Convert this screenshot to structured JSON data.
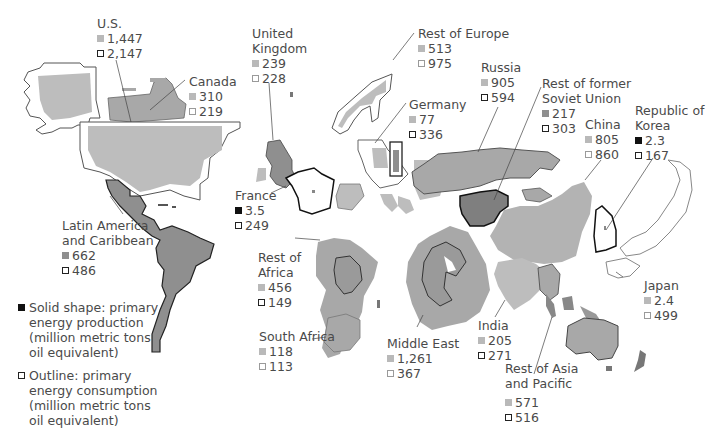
{
  "legend": {
    "production": "Solid shape: primary energy production (million metric tons oil equivalent)",
    "production_lines": [
      "Solid shape: primary",
      "energy production",
      "(million metric tons",
      "oil equivalent)"
    ],
    "consumption": "Outline: primary energy consumption (million metric tons oil equivalent)",
    "consumption_lines": [
      "Outline: primary",
      "energy consumption",
      "(million metric tons",
      "oil equivalent)"
    ]
  },
  "regions": {
    "us": {
      "name": "U.S.",
      "production": "1,447",
      "consumption": "2,147"
    },
    "canada": {
      "name": "Canada",
      "production": "310",
      "consumption": "219"
    },
    "uk": {
      "name_line1": "United",
      "name_line2": "Kingdom",
      "production": "239",
      "consumption": "228"
    },
    "rest_europe": {
      "name": "Rest of Europe",
      "production": "513",
      "consumption": "975"
    },
    "germany": {
      "name": "Germany",
      "production": "77",
      "consumption": "336"
    },
    "russia": {
      "name": "Russia",
      "production": "905",
      "consumption": "594"
    },
    "rest_fsu": {
      "name_line1": "Rest of former",
      "name_line2": "Soviet Union",
      "production": "217",
      "consumption": "303"
    },
    "china": {
      "name": "China",
      "production": "805",
      "consumption": "860"
    },
    "korea": {
      "name_line1": "Republic of",
      "name_line2": "Korea",
      "production": "2.3",
      "consumption": "167"
    },
    "france": {
      "name": "France",
      "production": "3.5",
      "consumption": "249"
    },
    "latam": {
      "name_line1": "Latin America",
      "name_line2": "and Caribbean",
      "production": "662",
      "consumption": "486"
    },
    "rest_africa": {
      "name_line1": "Rest of",
      "name_line2": "Africa",
      "production": "456",
      "consumption": "149"
    },
    "south_africa": {
      "name": "South Africa",
      "production": "118",
      "consumption": "113"
    },
    "middle_east": {
      "name": "Middle East",
      "production": "1,261",
      "consumption": "367"
    },
    "india": {
      "name": "India",
      "production": "205",
      "consumption": "271"
    },
    "japan": {
      "name": "Japan",
      "production": "2.4",
      "consumption": "499"
    },
    "rest_asia": {
      "name_line1": "Rest of Asia",
      "name_line2": "and Pacific",
      "production": "571",
      "consumption": "516"
    }
  },
  "colors": {
    "production_light": "#b9b9b9",
    "production_mid": "#8f8f8f",
    "production_dark": "#111111",
    "outline_dark": "#222222",
    "outline_light": "#9a9a9a"
  }
}
